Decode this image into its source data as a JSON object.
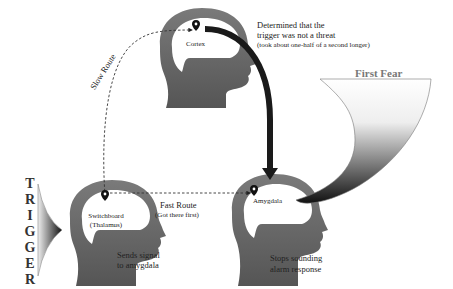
{
  "diagram": {
    "title_side": "TRIGGER",
    "trigger_letters": [
      "T",
      "R",
      "I",
      "G",
      "G",
      "E",
      "R"
    ],
    "nodes": {
      "cortex": {
        "label": "Cortex",
        "note_line1": "Determined that the",
        "note_line2": "trigger was not a threat",
        "note_line3": "(took about one-half of a second longer)"
      },
      "thalamus": {
        "label_line1": "Switchboard",
        "label_line2": "(Thalamus)",
        "note_line1": "Sends signal",
        "note_line2": "to amygdala"
      },
      "amygdala": {
        "label": "Amygdala",
        "note_line1": "Stops sounding",
        "note_line2": "alarm response"
      }
    },
    "routes": {
      "slow": "Slow Route",
      "fast": "Fast Route",
      "fast_note": "(Got there first)"
    },
    "fear_shape_title": "First Fear",
    "icons": [
      "location-pin-icon",
      "location-pin-icon",
      "location-pin-icon"
    ],
    "colors": {
      "head_fill": "#5a5a5a",
      "head_light": "#8a8a8a",
      "brain_fill": "#ffffff",
      "arrow_dark": "#1a1a1a",
      "text": "#222222"
    }
  }
}
